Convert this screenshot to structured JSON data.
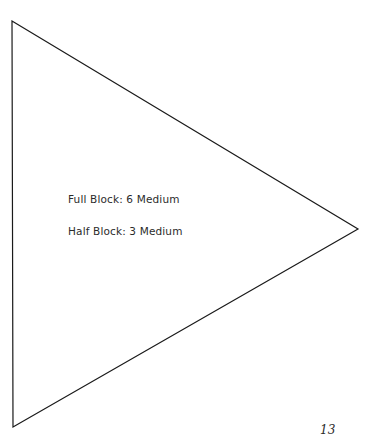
{
  "page": {
    "background_color": "#ffffff",
    "width": 368,
    "height": 440,
    "page_number": "13"
  },
  "shape": {
    "name": "right-pointing-triangle",
    "type": "triangle",
    "stroke_color": "#1a1a1a",
    "fill_color": "none",
    "stroke_width": 1.2,
    "vertices": [
      {
        "label": "top-left",
        "x": 12,
        "y": 21
      },
      {
        "label": "right-apex",
        "x": 358,
        "y": 229
      },
      {
        "label": "bottom-left",
        "x": 13,
        "y": 427
      }
    ],
    "points_attr": "12,21 358,229 13,427"
  },
  "labels": {
    "text_color": "#2b2b2b",
    "full_block": "Full Block: 6 Medium",
    "half_block": "Half Block: 3 Medium"
  }
}
